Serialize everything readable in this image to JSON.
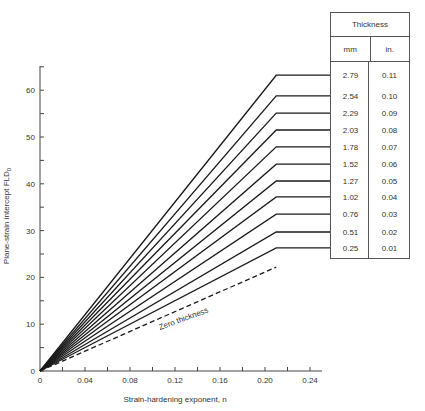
{
  "chart_data": {
    "type": "line",
    "title": "",
    "xlabel": "Strain-hardening exponent, n",
    "ylabel": "Plane-strain intercept  FLD0",
    "xlim": [
      0,
      0.26
    ],
    "ylim": [
      0,
      65
    ],
    "x_ticks": [
      "0",
      "0.04",
      "0.08",
      "0.12",
      "0.16",
      "0.20",
      "0.24"
    ],
    "x_minor_tick_step": 0.02,
    "y_ticks": [
      "0",
      "10",
      "20",
      "30",
      "40",
      "50",
      "60"
    ],
    "y_minor_tick_step": 5,
    "grid": false,
    "note": "Each line rises linearly from origin to n = 0.21, then stays constant (horizontal) toward the thickness table.",
    "knee_n": 0.21,
    "series": [
      {
        "name": "2.79 mm (0.11 in.)",
        "x": [
          0,
          0.21,
          0.26
        ],
        "y": [
          0,
          63.2,
          63.2
        ]
      },
      {
        "name": "2.54 mm (0.10 in.)",
        "x": [
          0,
          0.21,
          0.26
        ],
        "y": [
          0,
          58.8,
          58.8
        ]
      },
      {
        "name": "2.29 mm (0.09 in.)",
        "x": [
          0,
          0.21,
          0.26
        ],
        "y": [
          0,
          55.1,
          55.1
        ]
      },
      {
        "name": "2.03 mm (0.08 in.)",
        "x": [
          0,
          0.21,
          0.26
        ],
        "y": [
          0,
          51.5,
          51.5
        ]
      },
      {
        "name": "1.78 mm (0.07 in.)",
        "x": [
          0,
          0.21,
          0.26
        ],
        "y": [
          0,
          47.9,
          47.9
        ]
      },
      {
        "name": "1.52 mm (0.06 in.)",
        "x": [
          0,
          0.21,
          0.26
        ],
        "y": [
          0,
          44.2,
          44.2
        ]
      },
      {
        "name": "1.27 mm (0.05 in.)",
        "x": [
          0,
          0.21,
          0.26
        ],
        "y": [
          0,
          40.6,
          40.6
        ]
      },
      {
        "name": "1.02 mm (0.04 in.)",
        "x": [
          0,
          0.21,
          0.26
        ],
        "y": [
          0,
          37.2,
          37.2
        ]
      },
      {
        "name": "0.76 mm (0.03 in.)",
        "x": [
          0,
          0.21,
          0.26
        ],
        "y": [
          0,
          33.5,
          33.5
        ]
      },
      {
        "name": "0.51 mm (0.02 in.)",
        "x": [
          0,
          0.21,
          0.26
        ],
        "y": [
          0,
          29.7,
          29.7
        ]
      },
      {
        "name": "0.25 mm (0.01 in.)",
        "x": [
          0,
          0.21,
          0.26
        ],
        "y": [
          0,
          26.3,
          26.3
        ]
      },
      {
        "name": "Zero thickness",
        "style": "dashed",
        "x": [
          0,
          0.21
        ],
        "y": [
          0,
          22.2
        ]
      }
    ],
    "annotations": [
      {
        "text": "Zero thickness",
        "near_n": 0.15,
        "rotated": true
      }
    ]
  },
  "axes": {
    "xlabel": "Strain-hardening exponent, n",
    "ylabel_main": "Plane-strain intercept  FLD",
    "ylabel_sub": "0"
  },
  "annotation": {
    "zero_thickness": "Zero thickness"
  },
  "table": {
    "title": "Thickness",
    "col_mm": "mm",
    "col_in": "in.",
    "rows": [
      {
        "mm": "2.79",
        "in": "0.11"
      },
      {
        "mm": "2.54",
        "in": "0.10"
      },
      {
        "mm": "2.29",
        "in": "0.09"
      },
      {
        "mm": "2.03",
        "in": "0.08"
      },
      {
        "mm": "1.78",
        "in": "0.07"
      },
      {
        "mm": "1.52",
        "in": "0.06"
      },
      {
        "mm": "1.27",
        "in": "0.05"
      },
      {
        "mm": "1.02",
        "in": "0.04"
      },
      {
        "mm": "0.76",
        "in": "0.03"
      },
      {
        "mm": "0.51",
        "in": "0.02"
      },
      {
        "mm": "0.25",
        "in": "0.01"
      }
    ]
  },
  "colors": {
    "line": "#1a1a1a",
    "axis": "#444444",
    "text": "#333333"
  }
}
